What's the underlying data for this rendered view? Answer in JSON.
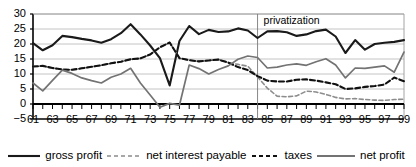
{
  "chart_data": {
    "type": "line",
    "title": "",
    "xlabel": "",
    "ylabel": "",
    "xlim": [
      61,
      99
    ],
    "ylim": [
      -5,
      30
    ],
    "yticks": [
      30,
      25,
      20,
      15,
      10,
      5,
      0,
      -5
    ],
    "xticks": [
      "61",
      "63",
      "65",
      "67",
      "69",
      "71",
      "73",
      "75",
      "77",
      "79",
      "81",
      "83",
      "85",
      "87",
      "89",
      "91",
      "93",
      "95",
      "97",
      "99"
    ],
    "grid": "horizontal",
    "legend_position": "bottom",
    "x": [
      61,
      62,
      63,
      64,
      65,
      66,
      67,
      68,
      69,
      70,
      71,
      72,
      73,
      74,
      75,
      76,
      77,
      78,
      79,
      80,
      81,
      82,
      83,
      84,
      85,
      86,
      87,
      88,
      89,
      90,
      91,
      92,
      93,
      94,
      95,
      96,
      97,
      98,
      99
    ],
    "series": [
      {
        "name": "gross profit",
        "style": "solid",
        "color": "#1a1a1a",
        "width": 2.1,
        "values": [
          20.3,
          17.9,
          19.6,
          22.7,
          22.3,
          21.7,
          21.2,
          20.4,
          21.6,
          23.6,
          26.6,
          23.2,
          19.5,
          15.3,
          6.2,
          21.0,
          26.0,
          23.3,
          24.7,
          24.0,
          24.2,
          25.2,
          24.5,
          22.0,
          24.2,
          24.3,
          23.9,
          22.7,
          23.2,
          24.3,
          24.8,
          22.5,
          17.0,
          21.3,
          18.1,
          20.0,
          20.4,
          20.7,
          21.3
        ]
      },
      {
        "name": "net interest payable",
        "style": "dashed-light",
        "color": "#8c8c8c",
        "width": 1.6,
        "values": [
          12.5,
          12.7,
          12.0,
          11.5,
          11.4,
          11.9,
          12.4,
          12.9,
          13.6,
          14.1,
          14.9,
          15.2,
          16.5,
          18.9,
          20.5,
          15.3,
          14.6,
          14.2,
          14.5,
          14.8,
          13.8,
          13.2,
          12.6,
          9.0,
          5.3,
          2.6,
          2.4,
          2.7,
          4.3,
          4.0,
          3.2,
          2.2,
          1.7,
          1.8,
          1.5,
          1.3,
          1.2,
          1.5,
          1.6
        ]
      },
      {
        "name": "taxes",
        "style": "dashed-heavy",
        "color": "#111111",
        "width": 2.1,
        "values": [
          12.5,
          12.7,
          12.0,
          11.5,
          11.4,
          11.9,
          12.4,
          12.9,
          13.6,
          14.1,
          14.9,
          15.2,
          16.5,
          18.9,
          20.5,
          15.3,
          14.6,
          14.2,
          14.5,
          14.8,
          13.8,
          12.3,
          11.3,
          9.3,
          7.8,
          7.5,
          7.5,
          8.1,
          8.2,
          7.8,
          7.2,
          6.6,
          5.0,
          5.2,
          5.7,
          6.0,
          6.5,
          8.8,
          7.6
        ]
      },
      {
        "name": "net profit",
        "style": "solid",
        "color": "#737373",
        "width": 1.7,
        "values": [
          7.0,
          4.4,
          7.9,
          11.3,
          10.2,
          8.7,
          7.8,
          7.0,
          8.9,
          10.0,
          11.9,
          7.0,
          3.0,
          -1.1,
          0.2,
          -0.4,
          13.0,
          11.8,
          10.0,
          11.5,
          12.7,
          14.9,
          16.0,
          15.5,
          12.0,
          12.3,
          13.0,
          13.4,
          12.9,
          14.1,
          15.1,
          13.0,
          8.7,
          12.0,
          11.9,
          12.3,
          12.7,
          10.6,
          17.3
        ]
      }
    ],
    "annotations": [
      {
        "text": "privatization",
        "x": 84,
        "kind": "vline-label"
      }
    ]
  },
  "legend": {
    "items": [
      {
        "label": "gross profit"
      },
      {
        "label": "net interest payable"
      },
      {
        "label": "taxes"
      },
      {
        "label": "net profit"
      }
    ]
  }
}
